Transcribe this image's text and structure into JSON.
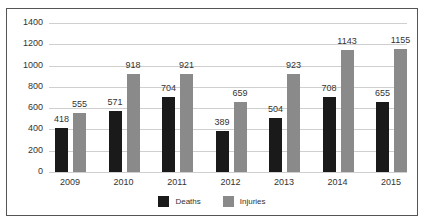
{
  "chart_data": {
    "type": "bar",
    "title": "",
    "xlabel": "",
    "ylabel": "",
    "categories": [
      "2009",
      "2010",
      "2011",
      "2012",
      "2013",
      "2014",
      "2015"
    ],
    "series": [
      {
        "name": "Deaths",
        "color": "#1a1a1a",
        "values": [
          418,
          571,
          704,
          389,
          504,
          708,
          655
        ]
      },
      {
        "name": "Injuries",
        "color": "#8a8a8a",
        "values": [
          555,
          918,
          921,
          659,
          923,
          1143,
          1155
        ]
      }
    ],
    "ylim": [
      0,
      1400
    ],
    "yticks": [
      "0",
      "200",
      "400",
      "600",
      "800",
      "1000",
      "1200",
      "1400"
    ],
    "grid": true,
    "legend_position": "bottom"
  },
  "legend": {
    "deaths": "Deaths",
    "injuries": "Injuries"
  }
}
